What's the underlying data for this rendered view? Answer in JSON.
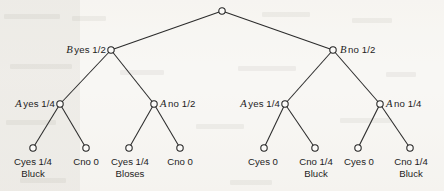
{
  "figure": {
    "type": "decision-tree",
    "background_color": "#f7f6f3",
    "ink_color": "#1d1d1d"
  },
  "root": {
    "label": ""
  },
  "level2": [
    {
      "var": "B",
      "text": "yes 1/2",
      "side": "left",
      "x": 111,
      "y": 50
    },
    {
      "var": "B",
      "text": "no 1/2",
      "side": "right",
      "x": 333,
      "y": 50
    }
  ],
  "level3": [
    {
      "var": "A",
      "text": "yes 1/4",
      "side": "left",
      "x": 60,
      "y": 104
    },
    {
      "var": "A",
      "text": "no 1/2",
      "side": "right",
      "x": 154,
      "y": 104
    },
    {
      "var": "A",
      "text": "yes 1/4",
      "side": "left",
      "x": 285,
      "y": 104
    },
    {
      "var": "A",
      "text": "no 1/4",
      "side": "right",
      "x": 380,
      "y": 104
    }
  ],
  "leaves": [
    {
      "var": "C",
      "text": "yes 1/4",
      "outcome_var": "B",
      "outcome": "luck",
      "x": 33,
      "y": 148
    },
    {
      "var": "C",
      "text": "no 0",
      "outcome_var": "",
      "outcome": "",
      "x": 86,
      "y": 148
    },
    {
      "var": "C",
      "text": "yes 1/4",
      "outcome_var": "B",
      "outcome": "loses",
      "x": 129,
      "y": 148
    },
    {
      "var": "C",
      "text": "no 0",
      "outcome_var": "",
      "outcome": "",
      "x": 180,
      "y": 148
    },
    {
      "var": "C",
      "text": "yes 0",
      "outcome_var": "",
      "outcome": "",
      "x": 264,
      "y": 148
    },
    {
      "var": "C",
      "text": "no 1/4",
      "outcome_var": "B",
      "outcome": "luck",
      "x": 315,
      "y": 148
    },
    {
      "var": "C",
      "text": "yes 0",
      "outcome_var": "",
      "outcome": "",
      "x": 358,
      "y": 148
    },
    {
      "var": "C",
      "text": "no 1/4",
      "outcome_var": "B",
      "outcome": "luck",
      "x": 410,
      "y": 148
    }
  ]
}
